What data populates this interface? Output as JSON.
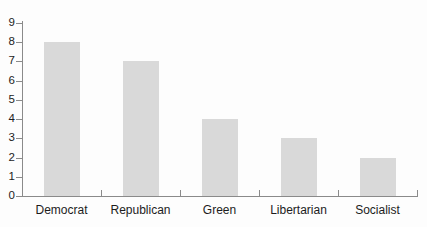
{
  "chart_data": {
    "type": "bar",
    "title": "",
    "subtitle": "",
    "xlabel": "",
    "ylabel": "",
    "categories": [
      "Democrat",
      "Republican",
      "Green",
      "Libertarian",
      "Socialist"
    ],
    "values": [
      8,
      7,
      4,
      3,
      2
    ],
    "series": [
      {
        "name": "",
        "values": [
          8,
          7,
          4,
          3,
          2
        ]
      }
    ],
    "ylim": [
      0,
      9
    ],
    "ytick_labels": [
      "0",
      "1",
      "2",
      "3",
      "4",
      "5",
      "6",
      "7",
      "8",
      "9"
    ],
    "ytick_values": [
      0,
      1,
      2,
      3,
      4,
      5,
      6,
      7,
      8,
      9
    ],
    "ytick_step": 1,
    "grid": false,
    "legend": false,
    "legend_position": "none",
    "annotations": [],
    "colors": {
      "background": "#fdfdfd",
      "bar_fill": "#d9d9d9",
      "axis": "#8a8a8a",
      "text": "#1c1c1c"
    }
  }
}
